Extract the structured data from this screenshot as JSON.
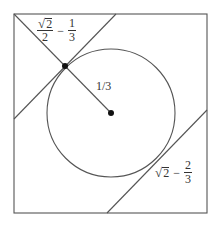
{
  "diagram": {
    "square": {
      "x1": 14,
      "y1": 14,
      "x2": 207,
      "y2": 213
    },
    "circle": {
      "cx": 111,
      "cy": 113,
      "r": 64
    },
    "center_dot": {
      "cx": 111,
      "cy": 113,
      "r": 3
    },
    "tangent_dot": {
      "cx": 65,
      "cy": 66,
      "r": 3
    },
    "lines": {
      "corner_diagonal": {
        "x1": 14,
        "y1": 14,
        "x2": 111,
        "y2": 113
      },
      "upper_left_tangent": {
        "x1": 14,
        "y1": 119,
        "x2": 116,
        "y2": 14
      },
      "lower_right_tangent": {
        "x1": 107,
        "y1": 213,
        "x2": 207,
        "y2": 110
      }
    },
    "colors": {
      "stroke": "#555555",
      "dot": "#111111",
      "text": "#333333"
    }
  },
  "labels": {
    "top_left": {
      "sqrt_symbol": "√",
      "radicand": "2",
      "numerator_den": "2",
      "minus": "−",
      "frac_num": "1",
      "frac_den": "3"
    },
    "radius": {
      "text": "1/3"
    },
    "bottom_right": {
      "sqrt_symbol": "√",
      "radicand": "2",
      "minus": "−",
      "frac_num": "2",
      "frac_den": "3"
    }
  }
}
